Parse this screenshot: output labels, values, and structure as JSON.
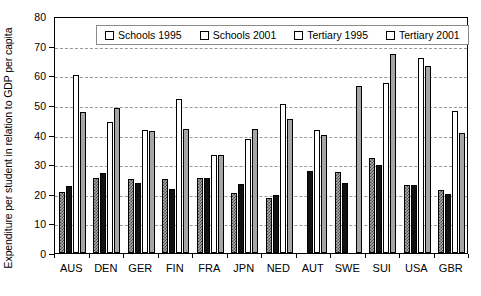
{
  "chart_data": {
    "type": "bar",
    "title": "",
    "xlabel": "",
    "ylabel": "Expenditure per student in relation to GDP per capita",
    "ylim": [
      0,
      80
    ],
    "yticks": [
      0,
      10,
      20,
      30,
      40,
      50,
      60,
      70,
      80
    ],
    "grid": true,
    "legend_position": "top-center",
    "categories": [
      "AUS",
      "DEN",
      "GER",
      "FIN",
      "FRA",
      "JPN",
      "NED",
      "AUT",
      "SWE",
      "SUI",
      "USA",
      "GBR"
    ],
    "series": [
      {
        "name": "Schools 1995",
        "fill": "hatched-grey",
        "values": [
          20.7,
          25.2,
          25.0,
          25.0,
          25.2,
          20.3,
          18.5,
          null,
          27.2,
          32.2,
          22.8,
          21.4
        ]
      },
      {
        "name": "Schools 2001",
        "fill": "black",
        "values": [
          22.6,
          27.0,
          23.6,
          21.6,
          25.3,
          23.2,
          19.5,
          27.8,
          23.6,
          29.7,
          23.0,
          19.8
        ]
      },
      {
        "name": "Tertiary 1995",
        "fill": "white",
        "values": [
          60.0,
          44.3,
          41.5,
          52.0,
          33.0,
          38.5,
          50.3,
          41.5,
          null,
          57.5,
          65.7,
          48.0
        ]
      },
      {
        "name": "Tertiary 2001",
        "fill": "grey",
        "values": [
          47.5,
          49.0,
          41.2,
          41.7,
          33.0,
          42.0,
          45.3,
          39.7,
          56.5,
          67.3,
          63.2,
          40.4
        ]
      }
    ]
  },
  "legend": {
    "items": [
      {
        "label": "Schools 1995"
      },
      {
        "label": "Schools 2001"
      },
      {
        "label": "Tertiary 1995"
      },
      {
        "label": "Tertiary 2001"
      }
    ]
  },
  "colors": {
    "schools_1995": "#a8a8a8",
    "schools_2001": "#111111",
    "tertiary_1995": "#ffffff",
    "tertiary_2001": "#a6a6a6",
    "gridline": "#9a9a9a",
    "axis": "#000000"
  }
}
